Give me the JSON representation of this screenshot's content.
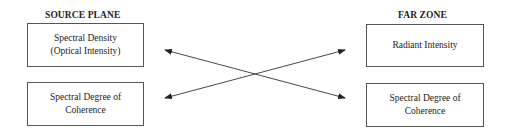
{
  "left_column": {
    "heading": "SOURCE PLANE",
    "boxes": [
      {
        "line1": "Spectral Density",
        "line2": "(Optical Intensity)"
      },
      {
        "line1": "Spectral Degree of",
        "line2": "Coherence"
      }
    ]
  },
  "right_column": {
    "heading": "FAR ZONE",
    "boxes": [
      {
        "line1": "Radiant Intensity"
      },
      {
        "line1": "Spectral Degree of",
        "line2": "Coherence"
      }
    ]
  },
  "arrows": [
    {
      "from": "Spectral Density (Optical Intensity)",
      "to": "Spectral Degree of Coherence (Far Zone)",
      "bidirectional": true
    },
    {
      "from": "Spectral Degree of Coherence (Source Plane)",
      "to": "Radiant Intensity",
      "bidirectional": true
    }
  ],
  "colors": {
    "line": "#333333",
    "border": "#555555"
  }
}
